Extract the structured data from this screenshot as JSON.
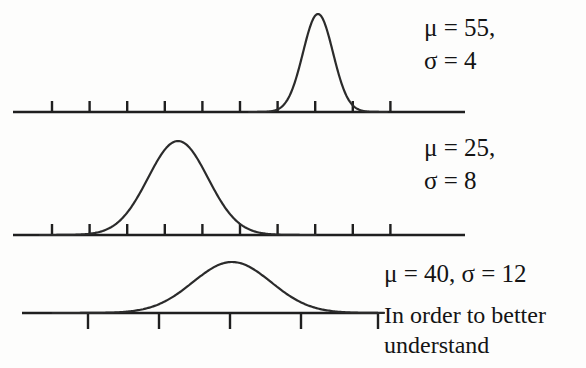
{
  "figure": {
    "ink_color": "#2b2b2b",
    "background_color": "#fdfdfc",
    "axis_color": "#1f1f1f"
  },
  "distributions": [
    {
      "id": "dist-1",
      "mu": 55,
      "sigma": 4,
      "label_line1": "μ = 55,",
      "label_line2": "σ = 4",
      "baseline_y": 112,
      "peak_x": 318,
      "peak_y": 14,
      "axis": {
        "x_start": 13,
        "x_end": 465,
        "tick_count": 10,
        "tick_first_x": 52,
        "tick_spacing": 37.6,
        "tick_direction": "up",
        "tick_length": 11
      }
    },
    {
      "id": "dist-2",
      "mu": 25,
      "sigma": 8,
      "label_line1": "μ = 25,",
      "label_line2": "σ = 8",
      "baseline_y": 235,
      "peak_x": 178,
      "peak_y": 141,
      "axis": {
        "x_start": 13,
        "x_end": 465,
        "tick_count": 10,
        "tick_first_x": 52,
        "tick_spacing": 37.6,
        "tick_direction": "up",
        "tick_length": 11
      }
    },
    {
      "id": "dist-3",
      "mu": 40,
      "sigma": 12,
      "label_line1": "μ = 40, σ = 12",
      "label_line2": "",
      "baseline_y": 313,
      "peak_x": 232,
      "peak_y": 262,
      "axis": {
        "x_start": 22,
        "x_end": 378,
        "tick_count": 4,
        "tick_first_x": 88,
        "tick_spacing": 71,
        "tick_direction": "down",
        "tick_length": 16
      }
    }
  ],
  "body_text": {
    "line1": "In order to better",
    "line2": "understand"
  },
  "chart_data": {
    "type": "line",
    "xlabel": "",
    "ylabel": "",
    "grid": false,
    "legend_position": "right",
    "series": [
      {
        "name": "μ = 55, σ = 4",
        "mu": 55,
        "sigma": 4,
        "peak_height_px": 98,
        "annotation": "μ = 55, σ = 4"
      },
      {
        "name": "μ = 25, σ = 8",
        "mu": 25,
        "sigma": 8,
        "peak_height_px": 94,
        "annotation": "μ = 25, σ = 8"
      },
      {
        "name": "μ = 40, σ = 12",
        "mu": 40,
        "sigma": 12,
        "peak_height_px": 51,
        "annotation": "μ = 40, σ = 12"
      }
    ]
  }
}
